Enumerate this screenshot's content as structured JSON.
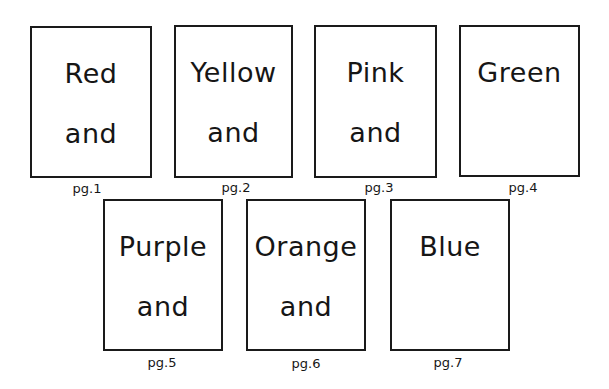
{
  "document": {
    "pages": [
      {
        "number_label": "pg.1",
        "lines": [
          "Red",
          "and"
        ]
      },
      {
        "number_label": "pg.2",
        "lines": [
          "Yellow",
          "and"
        ]
      },
      {
        "number_label": "pg.3",
        "lines": [
          "Pink",
          "and"
        ]
      },
      {
        "number_label": "pg.4",
        "lines": [
          "Green",
          ""
        ]
      },
      {
        "number_label": "pg.5",
        "lines": [
          "Purple",
          "and"
        ]
      },
      {
        "number_label": "pg.6",
        "lines": [
          "Orange",
          "and"
        ]
      },
      {
        "number_label": "pg.7",
        "lines": [
          "Blue",
          ""
        ]
      }
    ]
  }
}
